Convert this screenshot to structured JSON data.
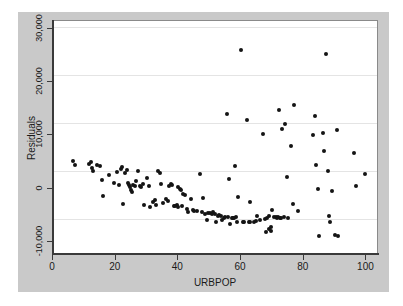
{
  "chart_data": {
    "type": "scatter",
    "title": "",
    "xlabel": "URBPOP",
    "ylabel": "Residuals",
    "xlim": [
      0,
      104
    ],
    "ylim": [
      -12500,
      31500
    ],
    "xticks": [
      0,
      20,
      40,
      60,
      80,
      100
    ],
    "xticklabels": [
      "0",
      "20",
      "40",
      "60",
      "80",
      "100"
    ],
    "yticks": [
      -10000,
      0,
      10000,
      20000,
      30000
    ],
    "yticklabels": [
      "-10,000",
      "0",
      "10,000",
      "20,000",
      "30,000"
    ],
    "grid": "horizontal",
    "legend": "none",
    "marker": "filled-circle",
    "marker_color": "#141414",
    "panel_background": "#ffffff",
    "figure_background": "#c9c9c9",
    "points": [
      [
        6.3,
        5200
      ],
      [
        7.0,
        4400
      ],
      [
        11.5,
        4700
      ],
      [
        12.0,
        5000
      ],
      [
        12.3,
        3900
      ],
      [
        12.6,
        3300
      ],
      [
        14.0,
        4500
      ],
      [
        15.0,
        4300
      ],
      [
        15.6,
        1600
      ],
      [
        16.0,
        -1400
      ],
      [
        18.0,
        2600
      ],
      [
        19.5,
        1100
      ],
      [
        20.4,
        3100
      ],
      [
        21.0,
        600
      ],
      [
        21.6,
        3600
      ],
      [
        22.0,
        4000
      ],
      [
        22.3,
        -2900
      ],
      [
        23.0,
        3000
      ],
      [
        23.6,
        3500
      ],
      [
        24.0,
        1000
      ],
      [
        24.4,
        600
      ],
      [
        24.6,
        200
      ],
      [
        25.0,
        -200
      ],
      [
        25.3,
        -600
      ],
      [
        25.6,
        600
      ],
      [
        26.0,
        400
      ],
      [
        26.4,
        1400
      ],
      [
        27.0,
        3300
      ],
      [
        27.6,
        500
      ],
      [
        28.0,
        200
      ],
      [
        28.6,
        900
      ],
      [
        29.0,
        -3100
      ],
      [
        30.0,
        2000
      ],
      [
        30.6,
        500
      ],
      [
        31.0,
        -3500
      ],
      [
        32.0,
        -2600
      ],
      [
        32.6,
        -2100
      ],
      [
        33.0,
        -3100
      ],
      [
        33.6,
        3300
      ],
      [
        34.0,
        3000
      ],
      [
        34.6,
        800
      ],
      [
        35.0,
        -2700
      ],
      [
        36.0,
        -2000
      ],
      [
        36.6,
        -2400
      ],
      [
        37.0,
        500
      ],
      [
        37.6,
        800
      ],
      [
        38.0,
        600
      ],
      [
        38.6,
        -3200
      ],
      [
        39.0,
        -3200
      ],
      [
        39.4,
        -3100
      ],
      [
        39.8,
        -3400
      ],
      [
        40.0,
        300
      ],
      [
        40.4,
        0
      ],
      [
        40.8,
        -200
      ],
      [
        41.0,
        -3300
      ],
      [
        41.6,
        -1100
      ],
      [
        42.0,
        -1300
      ],
      [
        42.6,
        -3900
      ],
      [
        43.0,
        -4400
      ],
      [
        44.0,
        -1900
      ],
      [
        44.6,
        -4100
      ],
      [
        45.0,
        -4300
      ],
      [
        46.0,
        -4200
      ],
      [
        47.0,
        2700
      ],
      [
        47.6,
        -4400
      ],
      [
        48.0,
        -1700
      ],
      [
        48.6,
        -4700
      ],
      [
        49.0,
        -5900
      ],
      [
        49.6,
        -4600
      ],
      [
        50.0,
        -4600
      ],
      [
        50.6,
        -4700
      ],
      [
        51.0,
        -4400
      ],
      [
        51.6,
        -4800
      ],
      [
        52.0,
        -6200
      ],
      [
        52.6,
        -5200
      ],
      [
        53.0,
        -5000
      ],
      [
        53.6,
        -5200
      ],
      [
        54.0,
        -5900
      ],
      [
        54.6,
        -5500
      ],
      [
        55.0,
        -5300
      ],
      [
        55.4,
        14000
      ],
      [
        55.8,
        -5300
      ],
      [
        56.0,
        1700
      ],
      [
        56.6,
        -6600
      ],
      [
        57.0,
        -5600
      ],
      [
        57.4,
        -5500
      ],
      [
        57.8,
        -5600
      ],
      [
        58.0,
        4200
      ],
      [
        58.4,
        -5400
      ],
      [
        58.8,
        -6200
      ],
      [
        59.0,
        -1500
      ],
      [
        60.0,
        26000
      ],
      [
        60.6,
        -6300
      ],
      [
        61.0,
        -6300
      ],
      [
        62.0,
        12800
      ],
      [
        62.4,
        -6300
      ],
      [
        62.8,
        -6200
      ],
      [
        63.0,
        -2600
      ],
      [
        64.0,
        -6200
      ],
      [
        64.6,
        -6100
      ],
      [
        65.0,
        -5100
      ],
      [
        66.0,
        -5900
      ],
      [
        67.0,
        10300
      ],
      [
        67.6,
        -5700
      ],
      [
        68.0,
        -8200
      ],
      [
        68.4,
        -5500
      ],
      [
        68.8,
        -7600
      ],
      [
        69.0,
        -5200
      ],
      [
        69.4,
        -7200
      ],
      [
        69.6,
        -8000
      ],
      [
        70.0,
        -4100
      ],
      [
        70.6,
        -5300
      ],
      [
        71.0,
        -5400
      ],
      [
        71.4,
        -5600
      ],
      [
        71.8,
        -5400
      ],
      [
        72.0,
        14800
      ],
      [
        72.4,
        -5500
      ],
      [
        72.8,
        -5500
      ],
      [
        73.0,
        11200
      ],
      [
        73.6,
        -5400
      ],
      [
        74.0,
        12100
      ],
      [
        74.6,
        2200
      ],
      [
        75.0,
        -5500
      ],
      [
        76.0,
        8000
      ],
      [
        76.6,
        -3000
      ],
      [
        77.0,
        15700
      ],
      [
        78.0,
        -4300
      ],
      [
        83.0,
        10000
      ],
      [
        83.6,
        13700
      ],
      [
        84.0,
        4500
      ],
      [
        84.6,
        0
      ],
      [
        85.0,
        -8900
      ],
      [
        86.0,
        10400
      ],
      [
        86.6,
        7000
      ],
      [
        87.0,
        25300
      ],
      [
        87.6,
        3300
      ],
      [
        88.0,
        -5200
      ],
      [
        88.4,
        -6300
      ],
      [
        89.0,
        -500
      ],
      [
        90.0,
        -8800
      ],
      [
        90.6,
        11000
      ],
      [
        91.0,
        -9000
      ],
      [
        96.0,
        6700
      ],
      [
        96.6,
        500
      ],
      [
        99.6,
        2800
      ]
    ]
  }
}
